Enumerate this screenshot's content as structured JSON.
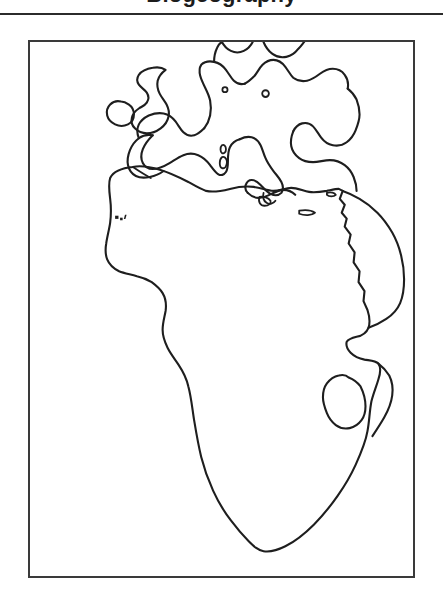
{
  "document": {
    "page_background": "#ffffff",
    "ink_color": "#1e1e1e",
    "heading": {
      "text": "Biogeography",
      "state": "cropped-at-top-edge",
      "visible_fragment": "bottom of one rounded bold glyph"
    },
    "rule": {
      "name": "header-divider",
      "color": "#2b2b2b"
    }
  },
  "figure": {
    "name": "outline-map-figure",
    "border_color": "#3a3a3a",
    "caption": "",
    "map": {
      "type": "coastline-outline-map",
      "projection_hint": "equirectangular",
      "fill": "none",
      "labels": [],
      "regions": [
        "British Isles",
        "Ireland",
        "Iberian Peninsula",
        "France",
        "Scandinavia and Denmark",
        "Baltic Sea",
        "Italy",
        "Greece and Aegean",
        "Anatolia / Turkey",
        "Black Sea",
        "Mediterranean Sea",
        "North Africa",
        "Canary Islands",
        "West African bulge",
        "Gulf of Guinea",
        "Red Sea",
        "Arabian Peninsula",
        "Horn of Africa",
        "Southern Africa",
        "Cape of Good Hope"
      ]
    }
  }
}
